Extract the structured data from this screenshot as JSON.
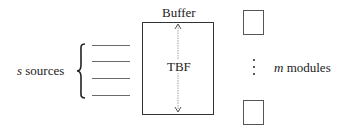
{
  "diagram": {
    "sources": {
      "variable": "s",
      "label": "sources",
      "line_count": 4
    },
    "buffer": {
      "title": "Buffer",
      "inner_label": "TBF"
    },
    "modules": {
      "variable": "m",
      "label": "modules",
      "ellipsis": "⋮"
    },
    "colors": {
      "stroke": "#333333",
      "text": "#222222",
      "arrow": "#888888"
    }
  }
}
